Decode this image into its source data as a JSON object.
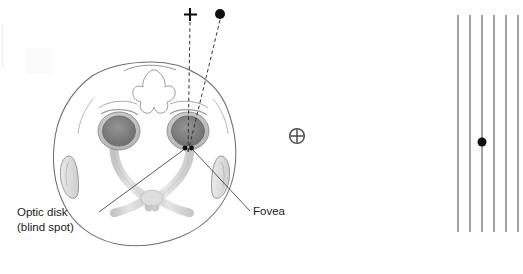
{
  "figure": {
    "width": 523,
    "height": 274,
    "background_color": "#ffffff"
  },
  "labels": {
    "optic_disk_line1": "Optic disk",
    "optic_disk_line2": "(blind spot)",
    "fovea": "Fovea"
  },
  "stimuli": {
    "plus_symbol": "+",
    "plus_position": {
      "x": 190,
      "y": 15
    },
    "dot_symbol": "●",
    "dot_position": {
      "x": 220,
      "y": 14
    },
    "dot_radius": 5.0,
    "target_color": "#111111"
  },
  "fixation_marker": {
    "symbol": "⊕",
    "name": "circled-plus",
    "position": {
      "x": 297,
      "y": 136
    },
    "radius": 7.5,
    "color": "#4a4a4a"
  },
  "head": {
    "outline_color": "#6d6d6d",
    "eye_iris_color": "#7e7e7e",
    "eye_outer_color": "#bdbdbd",
    "nerve_color": "#d2d2d2",
    "left_eye": {
      "x": 119,
      "y": 131
    },
    "right_eye": {
      "x": 188,
      "y": 131
    }
  },
  "retina_points": {
    "optic_disk": {
      "x": 185,
      "y": 148
    },
    "fovea": {
      "x": 191,
      "y": 148
    },
    "color": "#101010"
  },
  "sight_lines": {
    "plus_line_style": "dashed",
    "dot_line_style": "dashed",
    "dash_color": "#333333",
    "converge_point": {
      "x": 188,
      "y": 150
    }
  },
  "grating": {
    "name": "vertical-line-pattern",
    "line_count": 6,
    "line_color": "#8a8a8a",
    "line_width": 1.6,
    "x_positions": [
      458,
      470,
      482,
      494,
      506,
      518
    ],
    "y_top": 15,
    "y_bottom": 232,
    "dot": {
      "x": 482,
      "y": 142,
      "radius": 4.5,
      "color": "#101010"
    }
  },
  "leader_lines": {
    "optic_disk_leader": {
      "x1": 99,
      "y1": 212,
      "x2": 184,
      "y2": 149
    },
    "fovea_leader": {
      "x1": 250,
      "y1": 212,
      "x2": 192,
      "y2": 149
    },
    "color": "#3a3a3a"
  }
}
